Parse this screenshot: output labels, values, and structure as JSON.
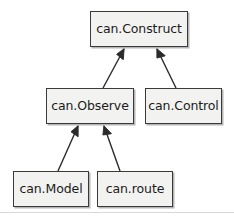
{
  "diagram": {
    "type": "uml-class-diagram",
    "relationship_type": "generalization",
    "arrow_head": "filled-triangle",
    "canvas": {
      "width": 234,
      "height": 220
    },
    "colors": {
      "box_fill": "#f2f2f0",
      "box_border": "#3a3a3a",
      "text": "#1b1b1b",
      "edge_line": "#2b2b2b",
      "shadow": "#5a5a5a",
      "background": "#ffffff",
      "rule": "#d8d8d8"
    },
    "nodes": [
      {
        "id": "construct",
        "label": "can.Construct",
        "x": 90,
        "y": 11,
        "w": 98,
        "h": 36,
        "level": 0
      },
      {
        "id": "observe",
        "label": "can.Observe",
        "x": 46,
        "y": 88,
        "w": 88,
        "h": 36,
        "level": 1
      },
      {
        "id": "control",
        "label": "can.Control",
        "x": 145,
        "y": 88,
        "w": 77,
        "h": 36,
        "level": 1
      },
      {
        "id": "model",
        "label": "can.Model",
        "x": 13,
        "y": 171,
        "w": 76,
        "h": 36,
        "level": 2
      },
      {
        "id": "route",
        "label": "can.route",
        "x": 97,
        "y": 171,
        "w": 76,
        "h": 36,
        "level": 2
      }
    ],
    "edges": [
      {
        "id": "observe-to-construct",
        "from": "observe",
        "to": "construct",
        "x1": 103,
        "y1": 88,
        "x2": 124,
        "y2": 49
      },
      {
        "id": "control-to-construct",
        "from": "control",
        "to": "construct",
        "x1": 176,
        "y1": 88,
        "x2": 157,
        "y2": 49
      },
      {
        "id": "model-to-observe",
        "from": "model",
        "to": "observe",
        "x1": 58,
        "y1": 171,
        "x2": 78,
        "y2": 126
      },
      {
        "id": "route-to-observe",
        "from": "route",
        "to": "observe",
        "x1": 120,
        "y1": 171,
        "x2": 104,
        "y2": 126
      }
    ],
    "bottom_rule": {
      "y": 212
    }
  }
}
